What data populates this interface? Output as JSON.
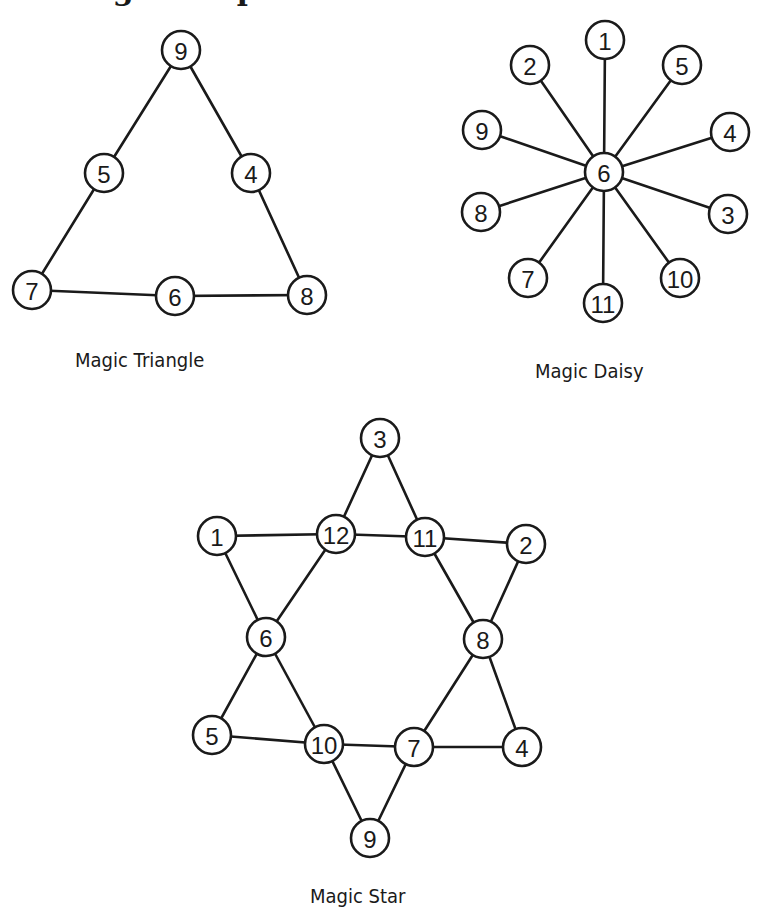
{
  "heading": {
    "text": "Magic Shapes"
  },
  "style": {
    "ink": "#1a1a1a",
    "background": "#ffffff",
    "node_radius": 19
  },
  "diagrams": {
    "triangle": {
      "caption": "Magic Triangle",
      "nodes": [
        {
          "id": "t9",
          "label": "9",
          "x": 181,
          "y": 50
        },
        {
          "id": "t5",
          "label": "5",
          "x": 104,
          "y": 173
        },
        {
          "id": "t4",
          "label": "4",
          "x": 251,
          "y": 173
        },
        {
          "id": "t7",
          "label": "7",
          "x": 32,
          "y": 290
        },
        {
          "id": "t6",
          "label": "6",
          "x": 175,
          "y": 296
        },
        {
          "id": "t8",
          "label": "8",
          "x": 307,
          "y": 295
        }
      ],
      "edges": [
        [
          "t9",
          "t5"
        ],
        [
          "t5",
          "t7"
        ],
        [
          "t9",
          "t4"
        ],
        [
          "t4",
          "t8"
        ],
        [
          "t7",
          "t6"
        ],
        [
          "t6",
          "t8"
        ]
      ]
    },
    "daisy": {
      "caption": "Magic Daisy",
      "nodes": [
        {
          "id": "d6",
          "label": "6",
          "x": 604,
          "y": 172
        },
        {
          "id": "d1",
          "label": "1",
          "x": 605,
          "y": 40
        },
        {
          "id": "d2",
          "label": "2",
          "x": 530,
          "y": 65
        },
        {
          "id": "d5",
          "label": "5",
          "x": 682,
          "y": 65
        },
        {
          "id": "d9",
          "label": "9",
          "x": 482,
          "y": 130
        },
        {
          "id": "d4",
          "label": "4",
          "x": 730,
          "y": 132
        },
        {
          "id": "d8",
          "label": "8",
          "x": 481,
          "y": 212
        },
        {
          "id": "d3",
          "label": "3",
          "x": 728,
          "y": 214
        },
        {
          "id": "d7",
          "label": "7",
          "x": 528,
          "y": 278
        },
        {
          "id": "d10",
          "label": "10",
          "x": 680,
          "y": 278
        },
        {
          "id": "d11",
          "label": "11",
          "x": 603,
          "y": 303
        }
      ],
      "edges": [
        [
          "d6",
          "d1"
        ],
        [
          "d6",
          "d2"
        ],
        [
          "d6",
          "d5"
        ],
        [
          "d6",
          "d9"
        ],
        [
          "d6",
          "d4"
        ],
        [
          "d6",
          "d8"
        ],
        [
          "d6",
          "d3"
        ],
        [
          "d6",
          "d7"
        ],
        [
          "d6",
          "d10"
        ],
        [
          "d6",
          "d11"
        ]
      ]
    },
    "star": {
      "caption": "Magic Star",
      "nodes": [
        {
          "id": "s3",
          "label": "3",
          "x": 380,
          "y": 438
        },
        {
          "id": "s1",
          "label": "1",
          "x": 217,
          "y": 536
        },
        {
          "id": "s12",
          "label": "12",
          "x": 336,
          "y": 534
        },
        {
          "id": "s11",
          "label": "11",
          "x": 425,
          "y": 537
        },
        {
          "id": "s2",
          "label": "2",
          "x": 526,
          "y": 544
        },
        {
          "id": "s6",
          "label": "6",
          "x": 266,
          "y": 637
        },
        {
          "id": "s8",
          "label": "8",
          "x": 483,
          "y": 639
        },
        {
          "id": "s5",
          "label": "5",
          "x": 212,
          "y": 735
        },
        {
          "id": "s10",
          "label": "10",
          "x": 324,
          "y": 744
        },
        {
          "id": "s7",
          "label": "7",
          "x": 414,
          "y": 747
        },
        {
          "id": "s4",
          "label": "4",
          "x": 522,
          "y": 747
        },
        {
          "id": "s9",
          "label": "9",
          "x": 370,
          "y": 838
        }
      ],
      "edges": [
        [
          "s3",
          "s12"
        ],
        [
          "s12",
          "s6"
        ],
        [
          "s6",
          "s5"
        ],
        [
          "s1",
          "s12"
        ],
        [
          "s12",
          "s11"
        ],
        [
          "s11",
          "s2"
        ],
        [
          "s1",
          "s6"
        ],
        [
          "s6",
          "s10"
        ],
        [
          "s10",
          "s9"
        ],
        [
          "s2",
          "s8"
        ],
        [
          "s8",
          "s7"
        ],
        [
          "s7",
          "s9"
        ],
        [
          "s3",
          "s11"
        ],
        [
          "s11",
          "s8"
        ],
        [
          "s8",
          "s4"
        ],
        [
          "s5",
          "s10"
        ],
        [
          "s10",
          "s7"
        ],
        [
          "s7",
          "s4"
        ]
      ]
    }
  }
}
